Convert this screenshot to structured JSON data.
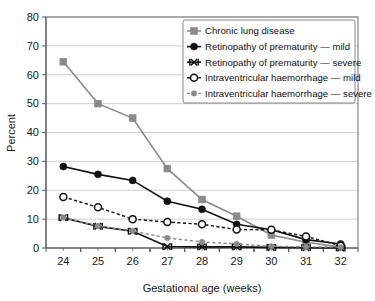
{
  "chart_data": {
    "type": "line",
    "title": "",
    "xlabel": "Gestational age (weeks)",
    "ylabel": "Percent",
    "x": [
      24,
      25,
      26,
      27,
      28,
      29,
      30,
      31,
      32
    ],
    "categories": [
      "24",
      "25",
      "26",
      "27",
      "28",
      "29",
      "30",
      "31",
      "32"
    ],
    "xlim": [
      23.5,
      32.5
    ],
    "ylim": [
      0,
      80
    ],
    "yticks": [
      0,
      10,
      20,
      30,
      40,
      50,
      60,
      70,
      80
    ],
    "ytick_labels": [
      "0",
      "10",
      "20",
      "30",
      "40",
      "50",
      "60",
      "70",
      "80"
    ],
    "grid": "horizontal",
    "legend_position": "top-right",
    "series": [
      {
        "name": "Chronic lung disease",
        "marker": "filled-square",
        "color": "#8a8a8a",
        "linestyle": "solid",
        "values": [
          64.5,
          50.0,
          45.0,
          27.5,
          16.8,
          11.0,
          4.5,
          2.0,
          0.3
        ]
      },
      {
        "name": "Retinopathy of prematurity — mild",
        "marker": "filled-circle",
        "color": "#111111",
        "linestyle": "solid",
        "values": [
          28.2,
          25.5,
          23.4,
          16.2,
          13.4,
          8.2,
          6.3,
          2.9,
          1.4
        ]
      },
      {
        "name": "Retinopathy of prematurity — severe",
        "marker": "cross-bar",
        "color": "#111111",
        "linestyle": "solid",
        "values": [
          10.5,
          7.5,
          5.8,
          0.5,
          0.4,
          0.4,
          0.2,
          0.1,
          0.0
        ]
      },
      {
        "name": "Intraventricular haemorrhage — mild",
        "marker": "open-circle",
        "color": "#111111",
        "linestyle": "dashed",
        "values": [
          17.7,
          14.1,
          10.0,
          9.0,
          8.2,
          6.4,
          6.3,
          4.0,
          0.8
        ]
      },
      {
        "name": "Intraventricular haemorrhage — severe",
        "marker": "small-filled-circle",
        "color": "#8a8a8a",
        "linestyle": "dashed",
        "values": [
          10.6,
          7.6,
          5.9,
          3.5,
          2.1,
          1.4,
          0.6,
          0.4,
          0.3
        ]
      }
    ]
  },
  "legend": {
    "items": [
      {
        "label": "Chronic lung disease"
      },
      {
        "label": "Retinopathy of prematurity — mild"
      },
      {
        "label": "Retinopathy of prematurity — severe"
      },
      {
        "label": "Intraventricular haemorrhage — mild"
      },
      {
        "label": "Intraventricular haemorrhage — severe"
      }
    ]
  },
  "axes": {
    "y_title": "Percent",
    "x_title": "Gestational age (weeks)",
    "y_labels": [
      "80",
      "70",
      "60",
      "50",
      "40",
      "30",
      "20",
      "10",
      "0"
    ],
    "x_labels": [
      "24",
      "25",
      "26",
      "27",
      "28",
      "29",
      "30",
      "31",
      "32"
    ]
  },
  "colors": {
    "gray_series": "#8a8a8a",
    "dark_series": "#111111",
    "gridline": "#c8c8c8",
    "axis": "#555555",
    "plot_background": "#ffffff",
    "legend_border": "#7a7a7a"
  }
}
